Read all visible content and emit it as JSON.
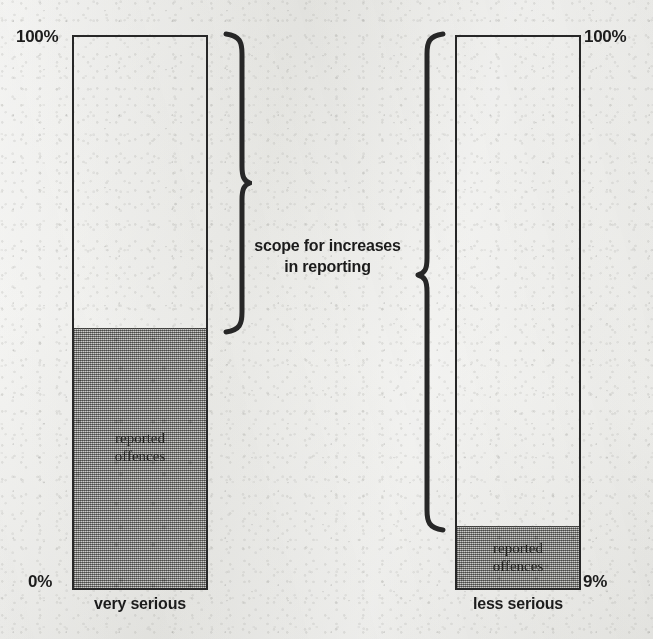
{
  "figure": {
    "caption_scope": "scope for increases\nin reporting",
    "caption_scope_line1": "scope for increases",
    "caption_scope_line2": "in reporting",
    "background_color": "#e9e9e6",
    "ink_color": "#272727",
    "fill_color": "#9d9d9a"
  },
  "bars": [
    {
      "id": "very-serious",
      "category_label": "very serious",
      "top_label": "100%",
      "bottom_label": "0%",
      "fill_label_line1": "reported",
      "fill_label_line2": "offences",
      "fill_percent": 47
    },
    {
      "id": "less-serious",
      "category_label": "less serious",
      "top_label": "100%",
      "bottom_label": "9%",
      "fill_label_line1": "reported",
      "fill_label_line2": "offences",
      "fill_percent": 11
    }
  ],
  "chart_data": {
    "type": "bar",
    "title": "",
    "xlabel": "",
    "ylabel": "",
    "ylim": [
      0,
      100
    ],
    "categories": [
      "very serious",
      "less serious"
    ],
    "series": [
      {
        "name": "reported offences",
        "values": [
          47,
          11
        ]
      },
      {
        "name": "scope for increases in reporting",
        "values": [
          53,
          89
        ]
      }
    ],
    "tick_labels": {
      "very serious": [
        "0%",
        "100%"
      ],
      "less serious": [
        "9%",
        "100%"
      ]
    },
    "annotations": [
      "scope for increases in reporting",
      "reported offences",
      "reported offences"
    ],
    "grid": false,
    "legend": "none",
    "stacked": true
  }
}
